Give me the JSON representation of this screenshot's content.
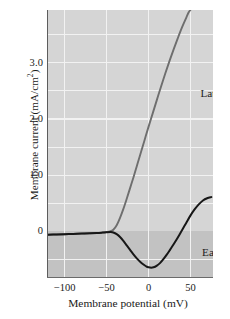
{
  "chart_data": {
    "type": "line",
    "title": "",
    "xlabel": "Membrane potential (mV)",
    "ylabel": "Membrane current (mA/cm²)",
    "ylabel_base": "Membrane current (mA/cm",
    "ylabel_exponent": "2",
    "ylabel_close": ")",
    "xlim": [
      -120,
      77
    ],
    "ylim": [
      -0.83,
      3.94
    ],
    "grid": true,
    "grid_x_values": [
      -100,
      -50,
      0,
      50
    ],
    "grid_y_values": [
      -0.5,
      0.5,
      1.0,
      1.5,
      2.0,
      2.5,
      3.0,
      3.5
    ],
    "xticks": [
      {
        "value": -100,
        "label": "−100"
      },
      {
        "value": -50,
        "label": "−50"
      },
      {
        "value": 0,
        "label": "0"
      },
      {
        "value": 50,
        "label": "50"
      }
    ],
    "yticks": [
      {
        "value": 0.0,
        "label": "0"
      },
      {
        "value": 1.0,
        "label": "1.0"
      },
      {
        "value": 2.0,
        "label": "2.0"
      },
      {
        "value": 3.0,
        "label": "3.0"
      }
    ],
    "zero_line": 0.0,
    "shaded_region_below_zero": true,
    "legend_position": "inline-annotations",
    "series": [
      {
        "name": "Late",
        "label": "Late",
        "color": "#6e6e6e",
        "annotation_xy": [
          62,
          2.45
        ],
        "points": [
          [
            -120,
            -0.06
          ],
          [
            -110,
            -0.055
          ],
          [
            -100,
            -0.05
          ],
          [
            -90,
            -0.045
          ],
          [
            -80,
            -0.04
          ],
          [
            -70,
            -0.035
          ],
          [
            -62,
            -0.03
          ],
          [
            -55,
            -0.022
          ],
          [
            -50,
            -0.012
          ],
          [
            -46,
            0.0
          ],
          [
            -42,
            0.03
          ],
          [
            -38,
            0.11
          ],
          [
            -34,
            0.24
          ],
          [
            -30,
            0.4
          ],
          [
            -26,
            0.58
          ],
          [
            -22,
            0.77
          ],
          [
            -18,
            0.96
          ],
          [
            -14,
            1.16
          ],
          [
            -10,
            1.36
          ],
          [
            -5,
            1.61
          ],
          [
            0,
            1.86
          ],
          [
            5,
            2.1
          ],
          [
            10,
            2.34
          ],
          [
            15,
            2.58
          ],
          [
            20,
            2.81
          ],
          [
            25,
            3.03
          ],
          [
            30,
            3.24
          ],
          [
            35,
            3.44
          ],
          [
            40,
            3.63
          ],
          [
            45,
            3.8
          ],
          [
            48,
            3.9
          ],
          [
            50,
            3.94
          ]
        ]
      },
      {
        "name": "Early",
        "label": "Early",
        "color": "#171717",
        "annotation_xy": [
          64,
          -0.38
        ],
        "points": [
          [
            -120,
            -0.06
          ],
          [
            -110,
            -0.055
          ],
          [
            -100,
            -0.05
          ],
          [
            -90,
            -0.045
          ],
          [
            -80,
            -0.04
          ],
          [
            -70,
            -0.035
          ],
          [
            -62,
            -0.03
          ],
          [
            -55,
            -0.022
          ],
          [
            -50,
            -0.015
          ],
          [
            -45,
            -0.012
          ],
          [
            -42,
            -0.02
          ],
          [
            -38,
            -0.05
          ],
          [
            -34,
            -0.1
          ],
          [
            -30,
            -0.17
          ],
          [
            -26,
            -0.25
          ],
          [
            -22,
            -0.33
          ],
          [
            -18,
            -0.41
          ],
          [
            -14,
            -0.48
          ],
          [
            -10,
            -0.54
          ],
          [
            -6,
            -0.59
          ],
          [
            -2,
            -0.63
          ],
          [
            2,
            -0.645
          ],
          [
            6,
            -0.64
          ],
          [
            10,
            -0.61
          ],
          [
            14,
            -0.56
          ],
          [
            18,
            -0.49
          ],
          [
            22,
            -0.41
          ],
          [
            26,
            -0.32
          ],
          [
            30,
            -0.23
          ],
          [
            35,
            -0.11
          ],
          [
            40,
            0.02
          ],
          [
            45,
            0.15
          ],
          [
            50,
            0.28
          ],
          [
            55,
            0.39
          ],
          [
            60,
            0.48
          ],
          [
            65,
            0.55
          ],
          [
            70,
            0.59
          ],
          [
            75,
            0.61
          ]
        ]
      }
    ]
  },
  "axes": {
    "ylabel_text": "Membrane current (mA/cm",
    "ylabel_sup": "2",
    "ylabel_tail": ")",
    "xlabel_text": "Membrane potential (mV)"
  },
  "annotations": {
    "late": "Late",
    "early": "Early"
  },
  "colors": {
    "plot_background": "#d5d5d5",
    "negative_band": "#c2c2c2",
    "gridline": "#f2f2f2",
    "late_curve": "#6e6e6e",
    "early_curve": "#171717",
    "axis_rule": "#5d5d5d",
    "text": "#1a1a1a",
    "page_background": "#ffffff"
  }
}
